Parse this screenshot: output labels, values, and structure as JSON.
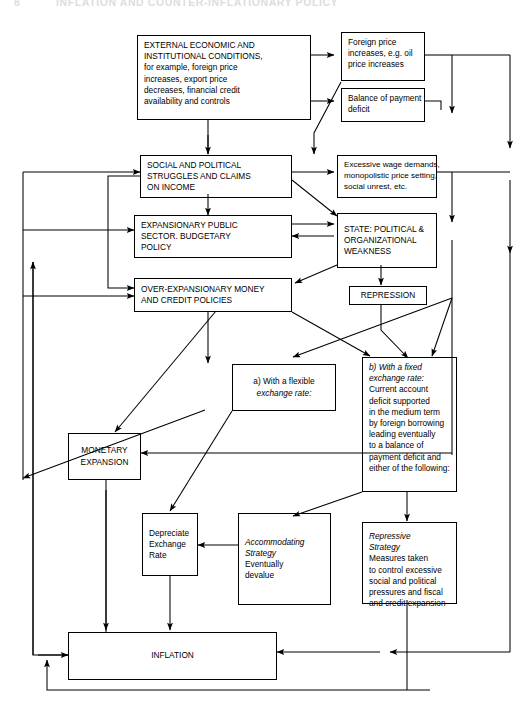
{
  "header": {
    "page_number": "8",
    "title": "INFLATION AND COUNTER-INFLATIONARY POLICY"
  },
  "diagram": {
    "type": "flowchart",
    "nodes": [
      {
        "id": "external",
        "name": "external-economic-conditions",
        "lines": [
          "EXTERNAL ECONOMIC AND",
          "INSTITUTIONAL CONDITIONS,",
          "for example, foreign price",
          "increases, export price",
          "decreases, financial credit",
          "availability and controls"
        ]
      },
      {
        "id": "foreign_price",
        "name": "foreign-price-increases",
        "lines": [
          "Foreign price",
          "increases, e.g. oil",
          "price increases"
        ]
      },
      {
        "id": "balance_payment",
        "name": "balance-of-payment-deficit",
        "lines": [
          "Balance of payment",
          "deficit"
        ]
      },
      {
        "id": "social_political",
        "name": "social-political-struggles",
        "lines": [
          "SOCIAL AND POLITICAL",
          "STRUGGLES AND CLAIMS",
          "ON INCOME"
        ]
      },
      {
        "id": "excessive_wage",
        "name": "excessive-wage-demands",
        "lines": [
          "Excessive wage demands,",
          "monopolistic price setting,",
          "social unrest, etc."
        ]
      },
      {
        "id": "expansionary_public",
        "name": "expansionary-public-sector-policy",
        "lines": [
          "EXPANSIONARY PUBLIC",
          "SECTOR. BUDGETARY",
          "POLICY"
        ]
      },
      {
        "id": "state_weakness",
        "name": "state-political-organizational-weakness",
        "lines": [
          "STATE: POLITICAL &",
          "ORGANIZATIONAL",
          "WEAKNESS"
        ]
      },
      {
        "id": "over_expansionary",
        "name": "over-expansionary-money-credit-policies",
        "lines": [
          "OVER-EXPANSIONARY MONEY",
          "AND CREDIT POLICIES"
        ]
      },
      {
        "id": "repression",
        "name": "repression",
        "lines": [
          "REPRESSION"
        ]
      },
      {
        "id": "flexible_rate",
        "name": "flexible-exchange-rate-option",
        "lines": [
          "a) With a flexible",
          "exchange rate:"
        ],
        "italic_lines": [
          1
        ]
      },
      {
        "id": "fixed_rate",
        "name": "fixed-exchange-rate-option",
        "lines": [
          "b)  With a fixed",
          "exchange rate:",
          "Current account",
          "deficit supported",
          "in the medium term",
          "by foreign borrowing",
          "leading eventually",
          "to a balance of",
          "payment deficit and",
          "either of the following:"
        ],
        "italic_lines": [
          0,
          1
        ]
      },
      {
        "id": "monetary_expansion",
        "name": "monetary-expansion",
        "lines": [
          "MONETARY",
          "EXPANSION"
        ]
      },
      {
        "id": "depreciate",
        "name": "depreciate-exchange-rate",
        "lines": [
          "Depreciate",
          "Exchange",
          "Rate"
        ]
      },
      {
        "id": "accommodating",
        "name": "accommodating-strategy",
        "lines": [
          "Accommodating",
          "Strategy",
          "Eventually",
          "devalue"
        ],
        "italic_lines": [
          0,
          1
        ]
      },
      {
        "id": "repressive",
        "name": "repressive-strategy",
        "lines": [
          "Repressive",
          "Strategy",
          "Measures taken",
          "to control excessive",
          "social and political",
          "pressures and fiscal",
          "and credit expansion"
        ],
        "italic_lines": [
          0,
          1
        ]
      },
      {
        "id": "inflation",
        "name": "inflation",
        "lines": [
          "INFLATION"
        ]
      }
    ],
    "colors": {
      "line": "#000000",
      "background": "#ffffff",
      "text": "#000000"
    }
  }
}
